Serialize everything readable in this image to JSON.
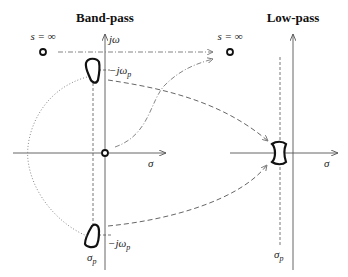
{
  "band_pass": {
    "title": "Band-pass",
    "jw_axis_label": "jω",
    "sigma_axis_label": "σ",
    "infinity_label": "s = ∞",
    "upper_marker_label": "−jω",
    "upper_marker_sub": "p",
    "lower_marker_label": "−jω",
    "lower_marker_sub": "p",
    "sigma_p_label": "σ",
    "sigma_p_sub": "p"
  },
  "low_pass": {
    "title": "Low-pass",
    "sigma_axis_label": "σ",
    "infinity_label": "s = ∞",
    "sigma_p_label": "σ",
    "sigma_p_sub": "p"
  },
  "colors": {
    "axis": "#555555",
    "curves": "#777777",
    "regions": "#111111"
  }
}
